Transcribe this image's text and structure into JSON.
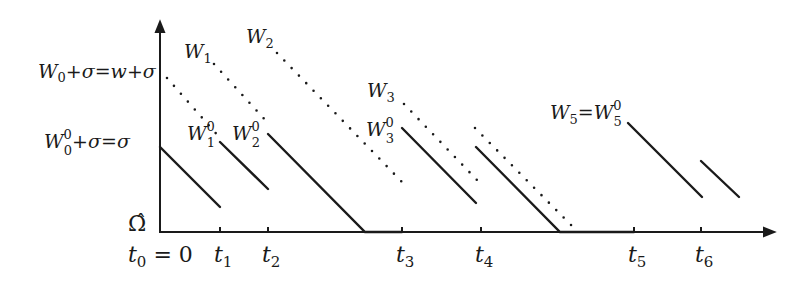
{
  "figure": {
    "colors": {
      "ink": "#1a1a1a",
      "background": "#ffffff"
    },
    "axes": {
      "origin": [
        160,
        232
      ],
      "y_axis_top": 20,
      "x_axis_end": 776,
      "y_label": "Ω̂",
      "x_ticks": [
        {
          "name": "t0",
          "label_main": "t",
          "label_sub": "0",
          "suffix": " = 0",
          "x": 160
        },
        {
          "name": "t1",
          "label_main": "t",
          "label_sub": "1",
          "suffix": "",
          "x": 220
        },
        {
          "name": "t2",
          "label_main": "t",
          "label_sub": "2",
          "suffix": "",
          "x": 268
        },
        {
          "name": "t3",
          "label_main": "t",
          "label_sub": "3",
          "suffix": "",
          "x": 402
        },
        {
          "name": "t4",
          "label_main": "t",
          "label_sub": "4",
          "suffix": "",
          "x": 481
        },
        {
          "name": "t5",
          "label_main": "t",
          "label_sub": "5",
          "suffix": "",
          "x": 634
        },
        {
          "name": "t6",
          "label_main": "t",
          "label_sub": "6",
          "suffix": "",
          "x": 701
        }
      ]
    },
    "y_labels": [
      {
        "name": "w-plus-sigma-label",
        "text_a": "W",
        "sub_a": "0",
        "rest": "+σ=w+σ",
        "x": 38,
        "y": 78
      },
      {
        "name": "sigma-label",
        "text_a": "W",
        "sub_a": "0",
        "sup_a": "0",
        "rest": "+σ=σ",
        "x": 44,
        "y": 150
      }
    ],
    "curve_labels": {
      "W1": {
        "main": "W",
        "sub": "1"
      },
      "W2": {
        "main": "W",
        "sub": "2"
      },
      "W3": {
        "main": "W",
        "sub": "3"
      },
      "W1_0": {
        "main": "W",
        "sub": "1",
        "sup": "0"
      },
      "W2_0": {
        "main": "W",
        "sub": "2",
        "sup": "0"
      },
      "W3_0": {
        "main": "W",
        "sub": "3",
        "sup": "0"
      },
      "W5_eq": {
        "main": "W",
        "sub": "5",
        "rest": "=",
        "main2": "W",
        "sub2": "5",
        "sup2": "0"
      }
    },
    "solid_segments": [
      {
        "name": "w0-solid",
        "points": [
          [
            160,
            147
          ],
          [
            220,
            207
          ]
        ]
      },
      {
        "name": "w1-solid",
        "points": [
          [
            220,
            142
          ],
          [
            268,
            189
          ]
        ]
      },
      {
        "name": "w2-solid",
        "points": [
          [
            268,
            134
          ],
          [
            365,
            232
          ],
          [
            402,
            232
          ]
        ]
      },
      {
        "name": "w3-solid",
        "points": [
          [
            402,
            128
          ],
          [
            476,
            203
          ]
        ]
      },
      {
        "name": "w4-solid",
        "points": [
          [
            476,
            147
          ],
          [
            560,
            232
          ],
          [
            634,
            232
          ]
        ]
      },
      {
        "name": "w5-solid",
        "points": [
          [
            628,
            123
          ],
          [
            702,
            197
          ]
        ]
      },
      {
        "name": "w6-solid",
        "points": [
          [
            701,
            161
          ],
          [
            739,
            197
          ]
        ]
      }
    ],
    "dotted_segments": [
      {
        "name": "w0-dotted",
        "points": [
          [
            167,
            78
          ],
          [
            220,
            138
          ]
        ]
      },
      {
        "name": "w1-dotted",
        "points": [
          [
            214,
            64
          ],
          [
            268,
            123
          ]
        ]
      },
      {
        "name": "w2-dotted",
        "points": [
          [
            277,
            53
          ],
          [
            403,
            183
          ]
        ]
      },
      {
        "name": "w3-dotted",
        "points": [
          [
            404,
            104
          ],
          [
            477,
            180
          ]
        ]
      },
      {
        "name": "w4-dotted",
        "points": [
          [
            475,
            128
          ],
          [
            572,
            226
          ]
        ]
      }
    ]
  }
}
